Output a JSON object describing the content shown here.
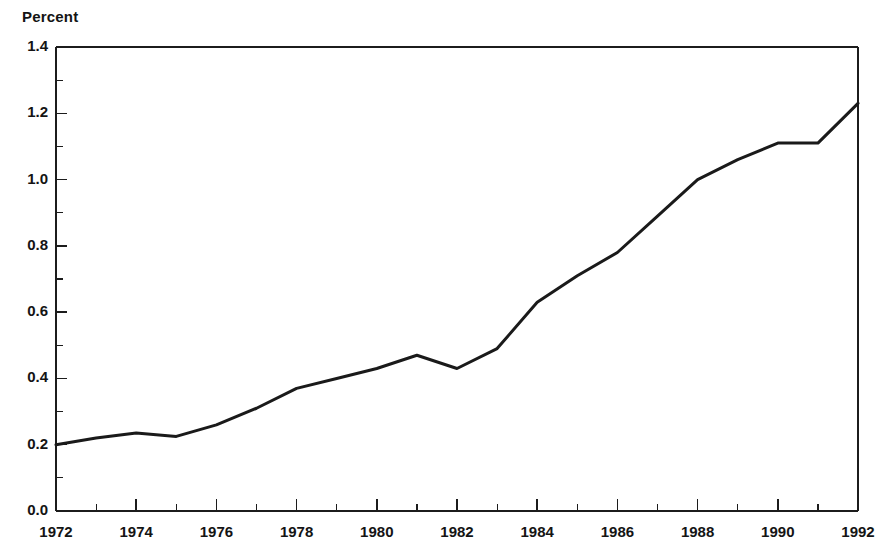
{
  "chart_data": {
    "type": "line",
    "title": "",
    "ylabel": "Percent",
    "xlabel": "",
    "ylim": [
      0.0,
      1.4
    ],
    "xlim": [
      1972,
      1992
    ],
    "grid": false,
    "legend": null,
    "y_tick_labels": [
      "0.0",
      "0.2",
      "0.4",
      "0.6",
      "0.8",
      "1.0",
      "1.2",
      "1.4"
    ],
    "y_ticks": [
      0.0,
      0.2,
      0.4,
      0.6,
      0.8,
      1.0,
      1.2,
      1.4
    ],
    "y_minor_ticks": [
      0.1,
      0.3,
      0.5,
      0.7,
      0.9,
      1.1,
      1.3
    ],
    "x_tick_labels": [
      "1972",
      "1974",
      "1976",
      "1978",
      "1980",
      "1982",
      "1984",
      "1986",
      "1988",
      "1990",
      "1992"
    ],
    "x_ticks": [
      1972,
      1974,
      1976,
      1978,
      1980,
      1982,
      1984,
      1986,
      1988,
      1990,
      1992
    ],
    "x_minor_ticks": [
      1973,
      1975,
      1977,
      1979,
      1981,
      1983,
      1985,
      1987,
      1989,
      1991
    ],
    "series": [
      {
        "name": "Percent",
        "color": "#1a1a1a",
        "x": [
          1972,
          1973,
          1974,
          1975,
          1976,
          1977,
          1978,
          1979,
          1980,
          1981,
          1982,
          1983,
          1984,
          1985,
          1986,
          1987,
          1988,
          1989,
          1990,
          1991,
          1992
        ],
        "values": [
          0.2,
          0.22,
          0.235,
          0.225,
          0.26,
          0.31,
          0.37,
          0.4,
          0.43,
          0.47,
          0.43,
          0.49,
          0.63,
          0.71,
          0.78,
          0.89,
          1.0,
          1.06,
          1.11,
          1.11,
          1.23
        ]
      }
    ]
  },
  "axis": {
    "y_title": "Percent"
  }
}
